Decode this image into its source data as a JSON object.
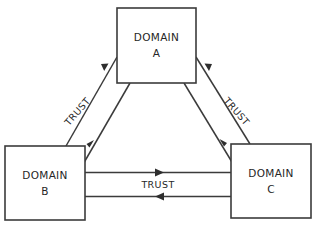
{
  "diagram": {
    "type": "trust-relationship-diagram",
    "background_color": "#ffffff",
    "line_color": "#3b3b3b",
    "text_color": "#262626",
    "nodes": [
      {
        "id": "domain-a",
        "label_line1": "DOMAIN",
        "label_line2": "A",
        "x": 117,
        "y": 8,
        "width": 79,
        "height": 75
      },
      {
        "id": "domain-b",
        "label_line1": "DOMAIN",
        "label_line2": "B",
        "x": 5,
        "y": 146,
        "width": 80,
        "height": 74
      },
      {
        "id": "domain-c",
        "label_line1": "DOMAIN",
        "label_line2": "C",
        "x": 231,
        "y": 144,
        "width": 80,
        "height": 74
      }
    ],
    "edges": [
      {
        "id": "edge-b-a",
        "label": "TRUST",
        "from": "domain-b",
        "to": "domain-a",
        "direction": "bidirectional",
        "label_rotation": -49
      },
      {
        "id": "edge-a-c",
        "label": "TRUST",
        "from": "domain-a",
        "to": "domain-c",
        "direction": "bidirectional",
        "label_rotation": 49
      },
      {
        "id": "edge-b-c",
        "label": "TRUST",
        "from": "domain-b",
        "to": "domain-c",
        "direction": "bidirectional",
        "label_rotation": 0
      }
    ]
  }
}
